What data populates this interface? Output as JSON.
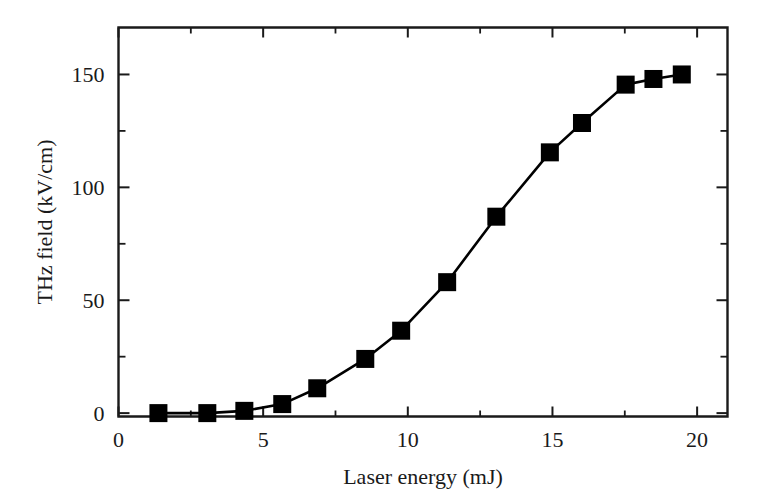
{
  "figure": {
    "background": "#ffffff",
    "foreground": "#1a1a1a",
    "marker_color": "#000000",
    "width": 760,
    "height": 499
  },
  "chart_data": {
    "type": "line",
    "title": "",
    "xlabel": "Laser energy (mJ)",
    "ylabel": "THz field (kV/cm)",
    "xlim": [
      0,
      21.05
    ],
    "ylim": [
      -1.5,
      170.8
    ],
    "grid": false,
    "legend": null,
    "marker": "square",
    "marker_size": 18,
    "line_style": "solid",
    "x_ticks_major": [
      0,
      5,
      10,
      15,
      20
    ],
    "x_ticks_major_labels": [
      "0",
      "5",
      "10",
      "15",
      "20"
    ],
    "x_ticks_minor": [
      2.5,
      7.5,
      12.5,
      17.5
    ],
    "y_ticks_major": [
      0,
      50,
      100,
      150
    ],
    "y_ticks_major_labels": [
      "0",
      "50",
      "100",
      "150"
    ],
    "y_ticks_minor": [
      25,
      75,
      125
    ],
    "series": [
      {
        "name": "THz field vs laser energy",
        "x": [
          1.38,
          3.07,
          4.35,
          5.66,
          6.87,
          8.53,
          9.77,
          11.36,
          13.06,
          14.91,
          16.02,
          17.53,
          18.49,
          19.47
        ],
        "y": [
          0.0,
          0.0,
          1.0,
          4.0,
          11.0,
          24.0,
          36.5,
          58.0,
          87.0,
          115.5,
          128.5,
          145.5,
          148.0,
          150.0
        ]
      }
    ]
  }
}
